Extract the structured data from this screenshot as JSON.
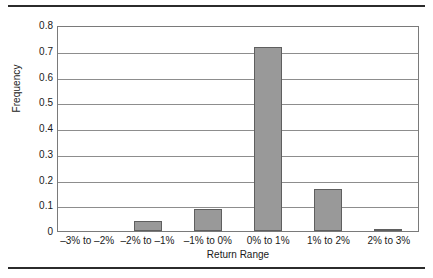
{
  "chart_data": {
    "type": "bar",
    "title": "",
    "subtitle": "",
    "xlabel": "Return Range",
    "ylabel": "Frequency",
    "categories": [
      "–3% to –2%",
      "–2% to –1%",
      "–1% to 0%",
      "0% to 1%",
      "1% to 2%",
      "2% to 3%"
    ],
    "values": [
      0,
      0.037,
      0.087,
      0.715,
      0.163,
      0.008
    ],
    "ylim": [
      0,
      0.8
    ],
    "xlim": null,
    "y_ticks": [
      "0.8",
      "0.7",
      "0.6",
      "0.5",
      "0.4",
      "0.3",
      "0.2",
      "0.1",
      "0"
    ],
    "y_tick_values": [
      0.8,
      0.7,
      0.6,
      0.5,
      0.4,
      0.3,
      0.2,
      0.1,
      0
    ],
    "grid": "horizontal",
    "legend": null,
    "legend_position": "none",
    "bar_color": "#999999",
    "bar_edge_color": "#5f5f5f",
    "gridline_color": "#8d8d8d",
    "plot_border_color": "#7a7a7a",
    "rule_color": "#2b2b2b"
  }
}
